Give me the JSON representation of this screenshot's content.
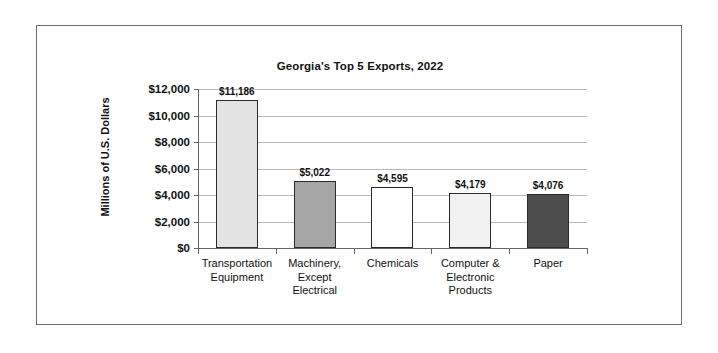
{
  "chart_data": {
    "type": "bar",
    "title": "Georgia's Top 5 Exports, 2022",
    "xlabel": "",
    "ylabel": "Millions of U.S. Dollars",
    "categories": [
      "Transportation Equipment",
      "Machinery, Except Electrical",
      "Chemicals",
      "Computer & Electronic Products",
      "Paper"
    ],
    "values": [
      11186,
      5022,
      4595,
      4179,
      4076
    ],
    "value_labels": [
      "$11,186",
      "$5,022",
      "$4,595",
      "$4,179",
      "$4,076"
    ],
    "bar_colors": [
      "#e3e3e3",
      "#a6a6a6",
      "#ffffff",
      "#f2f2f2",
      "#4d4d4d"
    ],
    "bar_border_color": "#2a2a2a",
    "ylim": [
      0,
      12000
    ],
    "ytick_values": [
      0,
      2000,
      4000,
      6000,
      8000,
      10000,
      12000
    ],
    "ytick_labels": [
      "$0",
      "$2,000",
      "$4,000",
      "$6,000",
      "$8,000",
      "$10,000",
      "$12,000"
    ],
    "grid": "horizontal",
    "legend": "none",
    "axis_color": "#666666",
    "gridline_color": "#b9b9b9",
    "frame_color": "#6e6e6e"
  },
  "categories_display": [
    {
      "lines": [
        "Transportation",
        "Equipment"
      ]
    },
    {
      "lines": [
        "Machinery,",
        "Except",
        "Electrical"
      ]
    },
    {
      "lines": [
        "Chemicals"
      ]
    },
    {
      "lines": [
        "Computer &",
        "Electronic",
        "Products"
      ]
    },
    {
      "lines": [
        "Paper"
      ]
    }
  ]
}
